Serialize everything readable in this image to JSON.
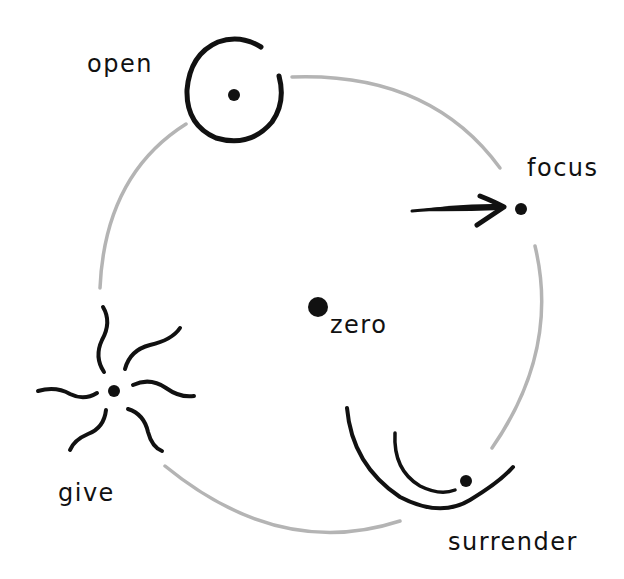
{
  "diagram": {
    "title": "",
    "background": "#ffffff",
    "ring_color": "#b4b4b4",
    "ink_color": "#111111",
    "center": {
      "label": "zero",
      "symbol": "large-dot"
    },
    "nodes": [
      {
        "id": "open",
        "label": "open",
        "symbol": "open-circle-with-dot",
        "position": "top-left"
      },
      {
        "id": "focus",
        "label": "focus",
        "symbol": "arrow-into-dot",
        "position": "right"
      },
      {
        "id": "surrender",
        "label": "surrender",
        "symbol": "nested-bowls-with-dot",
        "position": "bottom-right"
      },
      {
        "id": "give",
        "label": "give",
        "symbol": "radiating-wavy-lines-dot",
        "position": "bottom-left"
      }
    ]
  }
}
